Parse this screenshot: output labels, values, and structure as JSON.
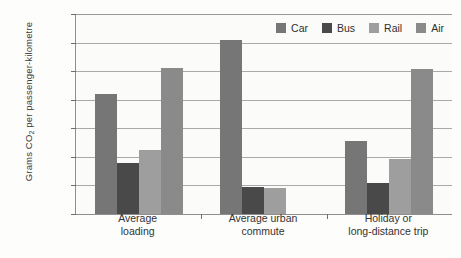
{
  "chart_data": {
    "type": "bar",
    "title": "",
    "xlabel": "",
    "ylabel": "Grams CO2 per passenger-kilometre",
    "ylabel_prefix": "Grams CO",
    "ylabel_sub": "2",
    "ylabel_suffix": " per passenger-kilometre",
    "categories": [
      "Average loading",
      "Average urban commute",
      "Holiday or long-distance trip"
    ],
    "categories_lines": [
      [
        "Average",
        "loading"
      ],
      [
        "Average urban",
        "commute"
      ],
      [
        "Holiday or",
        "long-distance trip"
      ]
    ],
    "series": [
      {
        "name": "Car",
        "color": "#767676",
        "values": [
          210,
          305,
          128
        ]
      },
      {
        "name": "Bus",
        "color": "#494949",
        "values": [
          90,
          47,
          55
        ]
      },
      {
        "name": "Rail",
        "color": "#9e9e9e",
        "values": [
          112,
          45,
          97
        ]
      },
      {
        "name": "Air",
        "color": "#8a8a8a",
        "values": [
          255,
          null,
          253
        ]
      }
    ],
    "ylim": [
      0,
      350
    ],
    "ytick_values": [
      0,
      50,
      100,
      150,
      200,
      250,
      300,
      350
    ],
    "ytick_labels": [
      "0",
      "50",
      "100",
      "150",
      "200",
      "250",
      "300",
      "350"
    ],
    "grid": true,
    "legend_position": "top-right-inside",
    "legend": [
      {
        "label": "Car",
        "color": "#767676"
      },
      {
        "label": "Bus",
        "color": "#494949"
      },
      {
        "label": "Rail",
        "color": "#9e9e9e"
      },
      {
        "label": "Air",
        "color": "#8a8a8a"
      }
    ]
  }
}
